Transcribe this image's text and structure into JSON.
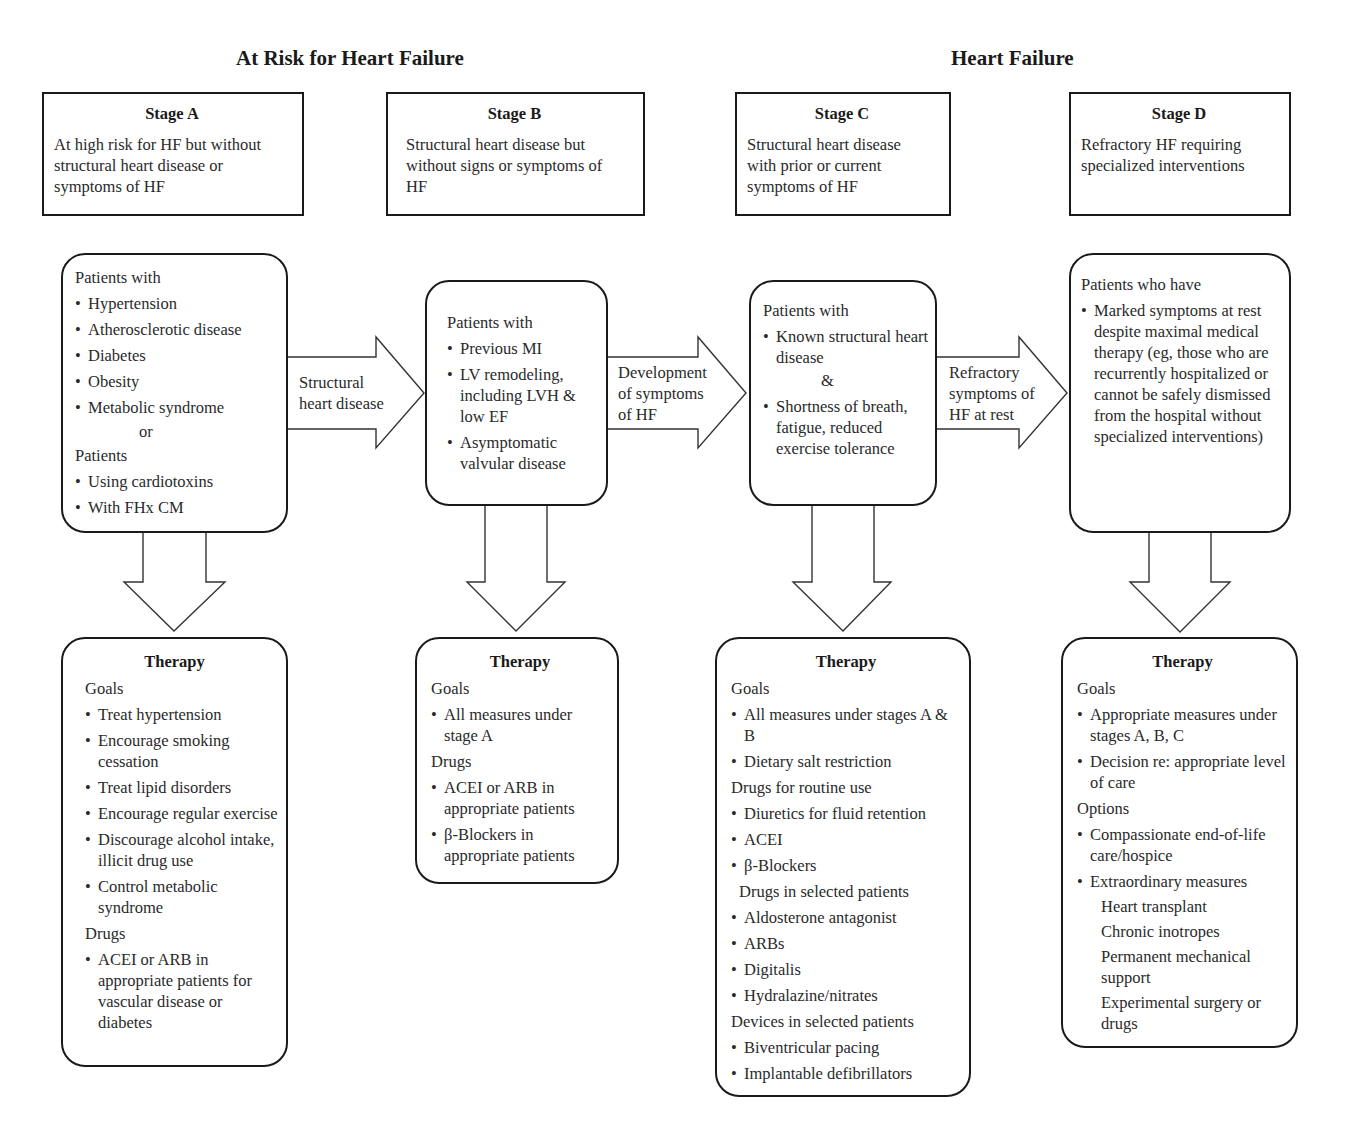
{
  "group_titles": {
    "at_risk": "At Risk for Heart Failure",
    "heart_failure": "Heart Failure"
  },
  "stages": [
    {
      "name": "Stage A",
      "description": "At high risk for HF but without structural heart disease or symptoms of HF"
    },
    {
      "name": "Stage B",
      "description": "Structural heart disease but without signs or symptoms of HF"
    },
    {
      "name": "Stage C",
      "description": "Structural heart disease with prior or current symptoms of HF"
    },
    {
      "name": "Stage D",
      "description": "Refractory HF requiring specialized interventions"
    }
  ],
  "patients": {
    "a": {
      "heading": "Patients with",
      "items": [
        "Hypertension",
        "Atherosclerotic disease",
        "Diabetes",
        "Obesity",
        "Metabolic syndrome"
      ],
      "connector": "or",
      "heading2": "Patients",
      "items2": [
        "Using cardiotoxins",
        "With FHx CM"
      ]
    },
    "b": {
      "heading": "Patients with",
      "items": [
        "Previous MI",
        "LV remodeling, including LVH & low EF",
        "Asymptomatic valvular disease"
      ]
    },
    "c": {
      "heading": "Patients with",
      "items": [
        "Known structural heart disease",
        "Shortness of breath, fatigue, reduced exercise tolerance"
      ],
      "connector": "&"
    },
    "d": {
      "heading": "Patients who have",
      "items": [
        "Marked symptoms at rest despite maximal medical therapy (eg, those who are recurrently hospitalized or cannot be safely dismissed from the hospital without specialized interventions)"
      ]
    }
  },
  "transitions": [
    {
      "label_line1": "Structural",
      "label_line2": "heart disease",
      "label_line3": ""
    },
    {
      "label_line1": "Development",
      "label_line2": "of symptoms",
      "label_line3": "of HF"
    },
    {
      "label_line1": "Refractory",
      "label_line2": "symptoms of",
      "label_line3": "HF at rest"
    }
  ],
  "therapy": {
    "title": "Therapy",
    "a": {
      "goals_label": "Goals",
      "goals": [
        "Treat hypertension",
        "Encourage smoking cessation",
        "Treat lipid disorders",
        "Encourage regular exercise",
        "Discourage alcohol intake, illicit drug use",
        "Control metabolic syndrome"
      ],
      "drugs_label": "Drugs",
      "drugs": [
        "ACEI or ARB in appropriate patients for vascular disease or diabetes"
      ]
    },
    "b": {
      "goals_label": "Goals",
      "goals": [
        "All measures under stage A"
      ],
      "drugs_label": "Drugs",
      "drugs": [
        "ACEI or ARB in appropriate patients",
        "β-Blockers in appropriate patients"
      ]
    },
    "c": {
      "goals_label": "Goals",
      "goals": [
        "All measures under stages A & B",
        "Dietary salt restriction"
      ],
      "routine_label": "Drugs for routine use",
      "routine": [
        "Diuretics for fluid retention",
        "ACEI",
        "β-Blockers"
      ],
      "selected_label": "Drugs in selected patients",
      "selected": [
        "Aldosterone antagonist",
        "ARBs",
        "Digitalis",
        "Hydralazine/nitrates"
      ],
      "devices_label": "Devices in selected patients",
      "devices": [
        "Biventricular pacing",
        "Implantable defibrillators"
      ]
    },
    "d": {
      "goals_label": "Goals",
      "goals": [
        "Appropriate measures under stages A, B, C",
        "Decision re:  appropriate level of care"
      ],
      "options_label": "Options",
      "options": [
        "Compassionate end-of-life care/hospice",
        "Extraordinary measures"
      ],
      "extraordinary": [
        "Heart transplant",
        "Chronic inotropes",
        "Permanent mechanical support",
        "Experimental surgery or drugs"
      ]
    }
  }
}
